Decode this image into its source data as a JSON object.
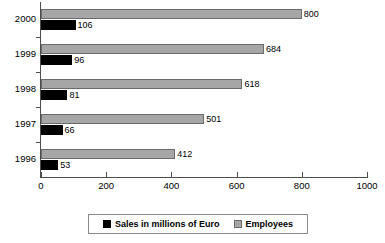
{
  "chart_data": {
    "type": "bar",
    "orientation": "horizontal",
    "title": "",
    "xlabel": "",
    "ylabel": "",
    "categories": [
      "2000",
      "1999",
      "1998",
      "1997",
      "1996"
    ],
    "series": [
      {
        "name": "Sales in millions of Euro",
        "color": "#000000",
        "values": [
          106,
          96,
          81,
          66,
          53
        ]
      },
      {
        "name": "Employees",
        "color": "#a6a6a6",
        "values": [
          800,
          684,
          618,
          501,
          412
        ]
      }
    ],
    "xlim": [
      0,
      1000
    ],
    "xticks": [
      "0",
      "200",
      "400",
      "600",
      "800",
      "1000"
    ],
    "grid": false,
    "legend_position": "bottom",
    "data_labels": true
  },
  "axis": {
    "x_ticks": [
      {
        "label": "0",
        "value": 0
      },
      {
        "label": "200",
        "value": 200
      },
      {
        "label": "400",
        "value": 400
      },
      {
        "label": "600",
        "value": 600
      },
      {
        "label": "800",
        "value": 800
      },
      {
        "label": "1000",
        "value": 1000
      }
    ],
    "y_categories": [
      "2000",
      "1999",
      "1998",
      "1997",
      "1996"
    ]
  },
  "groups": [
    {
      "year": "2000",
      "employees": {
        "value": 800,
        "label": "800"
      },
      "sales": {
        "value": 106,
        "label": "106"
      }
    },
    {
      "year": "1999",
      "employees": {
        "value": 684,
        "label": "684"
      },
      "sales": {
        "value": 96,
        "label": "96"
      }
    },
    {
      "year": "1998",
      "employees": {
        "value": 618,
        "label": "618"
      },
      "sales": {
        "value": 81,
        "label": "81"
      }
    },
    {
      "year": "1997",
      "employees": {
        "value": 501,
        "label": "501"
      },
      "sales": {
        "value": 66,
        "label": "66"
      }
    },
    {
      "year": "1996",
      "employees": {
        "value": 412,
        "label": "412"
      },
      "sales": {
        "value": 53,
        "label": "53"
      }
    }
  ],
  "legend": {
    "entries": [
      {
        "label": "Sales in millions of Euro",
        "color": "#000000",
        "swatch": "sales"
      },
      {
        "label": "Employees",
        "color": "#a6a6a6",
        "swatch": "employees"
      }
    ]
  },
  "colors": {
    "sales": "#000000",
    "employees": "#a6a6a6",
    "employees_border": "#6b6b6b",
    "axis": "#4d4d4d",
    "background": "#ffffff"
  }
}
